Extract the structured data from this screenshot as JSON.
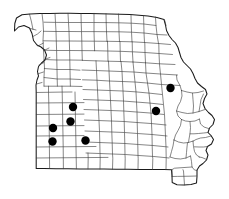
{
  "figure": {
    "kind": "choropleth-dot-distribution-map",
    "region_name": "Missouri",
    "subdivision_type": "county",
    "background_color": "#ffffff",
    "state_outline_color": "#1a1a1a",
    "county_line_color": "#3a3a3a",
    "marker_color": "#000000",
    "marker_shape": "filled-circle",
    "marker_radius_px": 4.2,
    "marked_county_count": 7,
    "title": "",
    "subtitle": "",
    "legend": "",
    "caption": "",
    "axis_labels": [],
    "tick_labels": [],
    "annotations": []
  },
  "viewbox": {
    "x": 0,
    "y": 0,
    "width": 229,
    "height": 199
  },
  "state_outline_path": "M14.5,31.0 L18.5,27.0 L24.0,25.5 L29.5,28.0 L32.0,33.5 L33.5,40.5 L37.0,45.0 L41.0,47.0 L44.5,50.0 L46.5,55.0 L45.0,60.0 L41.5,63.0 L38.5,66.5 L37.5,71.5 L38.5,76.0 L37.0,80.0 L36.0,85.0 L36.2,92.0 L36.2,100.0 L36.2,110.0 L36.2,120.0 L36.2,130.0 L36.2,140.0 L36.2,150.0 L36.2,160.0 L36.2,168.5 L44.0,168.6 L56.0,168.7 L68.0,168.8 L80.0,168.9 L92.0,169.0 L104.0,169.1 L116.0,169.2 L128.0,169.3 L140.0,169.4 L152.0,169.5 L164.0,169.6 L171.5,169.7 L172.0,176.0 L172.2,182.5 L177.0,184.8 L184.0,184.9 L191.0,184.6 L196.5,183.0 L197.0,176.5 L197.0,170.0 L199.5,166.0 L203.0,163.5 L206.5,160.0 L208.0,155.0 L206.0,150.5 L207.5,146.5 L211.5,144.0 L213.5,139.5 L211.0,135.5 L208.0,132.5 L209.5,128.0 L213.0,124.5 L214.5,119.5 L212.0,115.5 L208.5,112.5 L205.0,108.5 L203.0,103.5 L204.5,98.5 L207.0,94.0 L205.5,89.5 L201.5,86.5 L197.5,83.0 L195.0,78.5 L193.0,73.5 L190.5,69.0 L187.0,65.5 L183.5,62.0 L181.0,57.5 L179.5,52.5 L178.0,47.5 L175.5,43.0 L172.0,39.5 L169.0,35.5 L166.5,30.5 L165.5,25.0 L164.0,19.5 L157.0,17.5 L148.0,16.0 L139.0,15.2 L130.0,14.6 L120.0,14.2 L110.0,13.9 L100.0,13.7 L90.0,13.5 L80.0,13.4 L70.0,13.3 L60.0,13.3 L50.0,13.4 L40.0,13.6 L30.0,14.0 L22.0,14.8 L16.5,18.0 L14.8,23.5 Z",
  "county_lines_path": "M36.0,30.0 L30.5,28.5 M33.0,36.5 L37.5,34.0 L41.0,31.0 M38.0,46.0 L43.5,43.0 M44.0,50.5 L49.0,48.0 M45.5,59.0 L50.0,57.5 M39.0,65.0 L44.0,62.5 M37.5,74.0 L43.5,72.0 M36.5,84.0 L42.0,82.5 M29.5,14.2 L31.5,22.0 L33.0,29.5 M42.0,13.6 L43.0,22.0 L43.5,31.0 L43.0,40.5 L43.5,50.0 L44.0,59.0 L44.5,68.0 L44.0,77.0 L44.0,86.0 M36.3,92.5 L48.0,92.3 L60.0,92.1 L72.0,92.0 M36.3,103.0 L48.0,102.9 L60.0,102.8 L72.0,102.7 L84.0,102.6 M36.3,114.5 L48.0,114.4 L60.0,114.3 L72.0,114.2 L84.0,114.1 M36.3,126.0 L48.0,125.9 L60.0,125.8 L72.0,125.7 L84.0,125.6 M36.3,136.0 L48.0,135.9 L60.0,135.8 L72.0,135.7 L84.0,135.6 M36.3,147.0 L48.0,146.9 L60.0,146.8 L72.0,146.7 L84.0,146.6 L96.0,146.5 M36.3,158.0 L48.0,157.9 L60.0,157.8 L72.0,157.7 L84.0,157.6 L96.0,157.5 L108.0,157.4 M48.5,86.2 L48.5,92.4 L48.8,102.9 L49.0,114.4 L49.2,125.9 L49.3,136.0 L49.4,147.0 L49.5,158.0 L49.6,168.6 M62.0,86.1 L62.2,92.2 L62.4,102.8 L62.6,114.3 L62.8,125.8 L63.0,136.0 L63.2,147.0 L63.3,158.0 L63.4,168.7 M75.0,92.0 L75.2,102.7 L75.4,114.2 L75.6,125.7 L75.8,136.0 L76.0,147.0 L76.2,158.0 L76.4,168.8 M55.0,13.4 L55.5,22.5 L56.0,31.5 L56.3,41.0 L56.6,50.5 L56.8,60.0 L57.0,69.5 L57.2,79.0 L57.4,86.2 M68.0,13.3 L68.5,22.5 L69.0,31.5 L69.3,41.0 L69.6,50.5 L69.8,60.0 L70.0,69.5 L70.2,79.0 L70.4,86.2 M44.0,22.2 L55.5,22.4 L68.5,22.5 L81.0,22.5 L93.5,22.5 L106.0,22.6 M43.5,31.3 L56.0,31.5 L69.0,31.5 L81.5,31.6 L94.0,31.6 L106.5,31.7 M43.2,40.8 L56.3,41.0 L69.3,41.0 L81.8,41.1 L94.3,41.2 L107.0,41.3 M43.6,50.2 L56.6,50.5 L69.6,50.5 L82.0,50.6 L94.6,50.7 M44.2,59.5 L56.8,60.0 L69.8,60.0 L82.3,60.2 M44.3,68.5 L57.0,69.5 L70.0,69.5 L80.0,70.2 M44.1,77.5 L57.2,79.0 L70.2,79.0 L80.5,79.5 M44.0,86.2 L57.4,86.2 L70.4,86.2 L82.0,86.5 M81.0,13.4 L81.2,22.5 L81.5,31.6 L81.8,41.1 L82.0,50.6 L82.3,60.2 M94.0,13.3 L94.0,22.5 L94.0,31.6 L94.3,41.2 L94.6,50.7 M106.0,13.6 L106.2,22.6 L106.5,31.7 L107.0,41.3 M118.5,14.0 L118.8,22.8 L119.0,31.8 L119.5,41.5 M131.0,14.6 L131.2,23.2 L131.5,32.2 L132.0,41.8 M143.5,15.6 L143.8,24.0 L144.0,33.0 L144.5,42.5 M155.5,17.0 L156.0,25.5 L157.0,34.5 L158.5,43.5 M164.5,19.8 L166.0,25.5 M106.3,22.6 L118.8,22.8 L131.2,23.2 L143.8,24.0 L156.0,25.5 M106.8,31.7 L119.0,31.8 L131.5,32.2 L144.0,33.0 L157.0,34.5 L167.0,35.0 M107.2,41.3 L119.5,41.5 L132.0,41.8 L144.5,42.5 L158.5,43.5 L170.5,44.5 M94.8,50.7 L107.5,51.0 L120.0,51.3 L132.5,51.8 L145.0,52.5 L159.0,53.5 L172.5,54.5 M82.5,60.4 L95.0,60.8 L107.8,61.2 L120.5,61.5 L133.0,62.0 L145.5,62.8 L159.5,63.8 L175.0,64.5 M107.5,41.4 L107.8,51.0 L108.0,61.2 M120.0,41.6 L120.2,51.3 L120.5,61.5 M132.2,42.0 L132.4,51.8 L133.0,62.0 M144.8,42.8 L145.0,52.5 L145.5,62.8 M158.8,43.8 L159.0,53.5 L159.5,63.8 M82.0,70.0 L95.5,70.5 L108.5,71.0 L121.0,71.5 L133.5,72.0 L146.0,73.0 L160.5,74.0 L177.5,75.0 M82.5,79.8 L96.0,80.2 L109.0,81.0 L122.0,81.5 L134.5,82.0 L147.0,83.0 L161.5,84.5 L180.0,85.5 M83.0,89.5 L96.5,90.0 L109.5,90.5 L122.5,91.0 L135.0,91.8 L148.0,93.0 L162.0,94.5 M83.5,99.5 L97.0,100.0 L110.0,100.5 L123.0,101.0 L136.0,102.0 L149.0,103.0 L163.0,104.5 M84.0,109.5 L97.5,110.0 L110.5,110.5 L123.5,111.0 L136.5,112.0 L150.0,113.0 L164.0,114.5 M84.5,120.0 L98.0,120.5 L111.0,121.0 L124.0,121.5 L137.0,122.5 L151.0,123.5 L166.0,125.0 M85.0,131.0 L98.5,131.5 L111.5,132.0 L124.5,132.5 L137.5,133.5 L152.0,134.5 L167.0,136.0 M85.5,142.0 L99.0,142.5 L112.0,143.0 L125.0,143.5 L138.5,144.5 L153.0,145.5 L168.0,147.0 M86.0,153.0 L99.5,153.5 L112.5,154.0 L125.5,154.5 L139.0,155.5 L154.0,156.5 L169.0,158.0 M88.0,168.9 L88.2,158.0 L88.0,153.0 M100.0,169.1 L100.2,158.0 L100.0,153.2 L99.8,142.5 L99.5,131.5 L99.0,120.5 L98.5,110.0 L98.0,100.0 L97.5,90.0 L97.0,80.2 L96.5,70.5 L96.0,60.8 M112.5,169.2 L112.8,158.2 L112.5,154.0 L112.2,143.0 L111.8,132.0 L111.5,121.0 L111.0,110.5 L110.5,100.5 L110.0,90.5 L109.5,81.0 L109.0,71.0 L108.5,61.2 M125.0,169.3 L125.2,158.3 L125.0,154.5 L124.8,143.5 L124.5,132.5 L124.2,121.5 L123.8,111.0 L123.5,101.0 L123.0,91.0 L122.5,81.5 L122.0,71.5 L121.0,61.4 M138.0,169.4 L138.2,158.4 L138.0,155.5 L137.8,144.5 L137.5,133.5 L137.2,122.5 L137.0,112.0 L136.5,102.0 L136.0,92.0 L135.0,82.0 L134.0,72.0 L133.0,62.0 M152.5,169.5 L152.8,158.5 L152.5,156.5 L152.2,145.5 L152.0,134.5 L151.5,123.5 L151.0,113.0 L150.0,103.0 L149.0,93.0 L147.5,83.0 L146.0,73.0 L145.5,62.8 M166.0,169.6 L166.2,158.8 L166.0,147.2 L165.5,136.0 L165.0,125.0 L164.5,114.5 L163.5,104.5 L162.5,94.5 L161.5,84.5 L160.5,74.0 L159.5,64.5 M176.5,75.2 L177.0,80.0 L180.0,85.5 L181.5,90.5 M181.5,90.5 L182.0,96.0 L180.5,101.5 L178.0,106.0 L176.5,111.0 L178.0,116.0 L181.5,119.5 M181.5,119.5 L185.5,121.0 L190.0,121.5 L195.0,121.0 L199.5,119.0 M181.5,119.5 L180.5,125.5 L178.0,130.5 L175.5,135.0 L174.0,140.0 M174.0,140.0 L178.5,142.0 L183.5,143.0 L188.5,142.5 L193.0,141.0 M174.0,140.0 L173.0,146.0 L171.5,151.5 L170.0,157.0 M170.0,157.0 L175.0,158.5 L180.5,159.0 L186.0,158.0 L190.5,156.0 M181.5,90.5 L187.0,92.0 L192.5,93.0 L198.0,92.5 L203.5,91.0 M176.5,111.0 L182.0,112.5 L187.5,113.5 L193.0,113.0 L199.0,111.5 L205.0,109.5 M190.5,156.0 L191.5,161.5 L192.0,167.0 L194.5,170.0 L197.0,170.5 M172.0,169.8 L172.2,176.5 M184.5,184.9 L184.0,178.0 L183.5,171.0 L183.0,169.7 M196.5,176.0 L190.0,176.2 L184.0,176.3 L177.5,176.4 L172.1,176.5 M192.0,167.0 L186.0,167.4 L180.0,167.8 L174.5,168.2 L171.8,169.7 M190.0,121.8 L190.5,127.5 L190.0,133.5 L189.0,139.0 L188.5,142.5 M186.0,158.2 L186.5,152.5 L187.0,147.0 L187.5,142.8 M192.5,93.2 L193.0,99.5 L193.5,106.0 L193.0,113.0 M199.5,119.2 L200.5,124.0 L204.0,127.0 L208.5,128.5 M199.0,111.7 L200.0,105.5 L201.0,99.5 L203.5,94.0 M193.0,141.2 L196.0,139.5 L200.5,138.0 L205.5,137.5 L211.0,136.0 M193.0,141.2 L193.5,146.5 L194.5,151.5 L196.5,155.0 L199.5,157.0 M206.5,159.5 L202.0,157.5 L199.0,157.0 M207.5,146.5 L203.5,147.0 L199.0,147.0 L194.2,146.8 M208.0,132.5 L203.5,133.0 L198.5,133.5 L194.0,133.8 L190.0,133.8",
  "markers": [
    {
      "id": 1,
      "cx": 73.0,
      "cy": 107.0,
      "label": ""
    },
    {
      "id": 2,
      "cx": 70.5,
      "cy": 121.5,
      "label": ""
    },
    {
      "id": 3,
      "cx": 53.0,
      "cy": 128.0,
      "label": ""
    },
    {
      "id": 4,
      "cx": 52.5,
      "cy": 141.5,
      "label": ""
    },
    {
      "id": 5,
      "cx": 85.5,
      "cy": 140.5,
      "label": ""
    },
    {
      "id": 6,
      "cx": 170.5,
      "cy": 88.0,
      "label": ""
    },
    {
      "id": 7,
      "cx": 156.0,
      "cy": 111.0,
      "label": ""
    }
  ]
}
